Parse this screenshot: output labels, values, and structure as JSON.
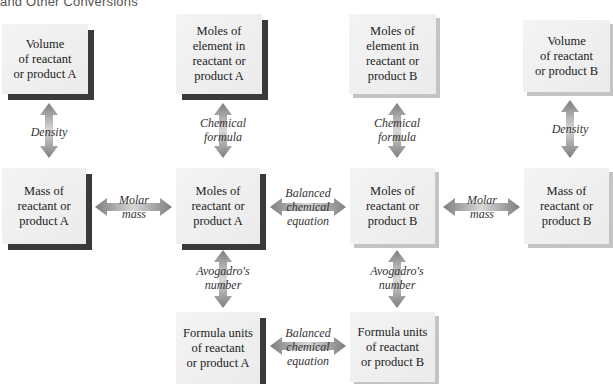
{
  "title": "and Other Conversions",
  "boxes": {
    "volume_a": "Volume\nof reactant\nor product A",
    "moles_element_a": "Moles of\nelement in\nreactant or\nproduct A",
    "moles_element_b": "Moles of\nelement in\nreactant or\nproduct B",
    "volume_b": "Volume\nof reactant\nor product B",
    "mass_a": "Mass of\nreactant or\nproduct A",
    "moles_a": "Moles of\nreactant or\nproduct A",
    "moles_b": "Moles of\nreactant or\nproduct B",
    "mass_b": "Mass of\nreactant or\nproduct B",
    "formula_units_a": "Formula units\nof reactant\nor product A",
    "formula_units_b": "Formula units\nof reactant\nor product B"
  },
  "labels": {
    "density_a": "Density",
    "chemical_formula_a": "Chemical\nformula",
    "chemical_formula_b": "Chemical\nformula",
    "density_b": "Density",
    "molar_mass_a": "Molar\nmass",
    "balanced_equation_moles": "Balanced\nchemical\nequation",
    "molar_mass_b": "Molar\nmass",
    "avogadro_a": "Avogadro's\nnumber",
    "avogadro_b": "Avogadro's\nnumber",
    "balanced_equation_units": "Balanced\nchemical\nequation"
  },
  "colors": {
    "arrow": "#8c8c8c",
    "box_fill": "#efefef",
    "shadow_a": "#3a3a3a",
    "shadow_b": "#c4c4c4"
  }
}
